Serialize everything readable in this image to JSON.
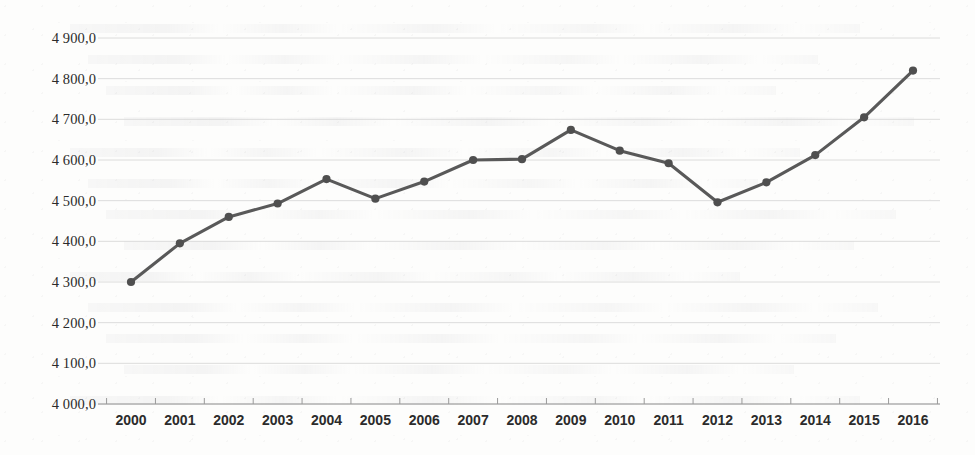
{
  "chart_data": {
    "type": "line",
    "title": "",
    "subtitle": "",
    "xlabel": "",
    "ylabel": "",
    "categories": [
      "2000",
      "2001",
      "2002",
      "2003",
      "2004",
      "2005",
      "2006",
      "2007",
      "2008",
      "2009",
      "2010",
      "2011",
      "2012",
      "2013",
      "2014",
      "2015",
      "2016"
    ],
    "series": [
      {
        "name": "",
        "values": [
          4300.0,
          4395.0,
          4460.0,
          4493.0,
          4553.0,
          4505.0,
          4547.0,
          4600.0,
          4602.0,
          4674.0,
          4623.0,
          4592.0,
          4496.0,
          4545.0,
          4612.0,
          4705.0,
          4820.0
        ]
      }
    ],
    "ylim": [
      4000.0,
      4900.0
    ],
    "ytick_step": 100.0,
    "ytick_labels": [
      "4 900,0",
      "4 800,0",
      "4 700,0",
      "4 600,0",
      "4 500,0",
      "4 400,0",
      "4 300,0",
      "4 200,0",
      "4 100,0",
      "4 000,0"
    ],
    "ytick_values": [
      4900.0,
      4800.0,
      4700.0,
      4600.0,
      4500.0,
      4400.0,
      4300.0,
      4200.0,
      4100.0,
      4000.0
    ],
    "grid": true,
    "grid_axis": "y",
    "legend": false,
    "legend_position": "none",
    "marker": "diamond",
    "annotations": []
  },
  "style": {
    "line_color": "#595959",
    "marker_color": "#4f4f4f",
    "grid_color": "#d8d8d8",
    "axis_color": "#9a9a9a",
    "text_color": "#2b2b2b",
    "background": "#fdfdfc"
  },
  "geometry": {
    "plot_left": 131,
    "plot_right": 913,
    "plot_top": 38,
    "plot_bottom": 404,
    "axis_end_right": 940,
    "ylabel_right": 96
  }
}
